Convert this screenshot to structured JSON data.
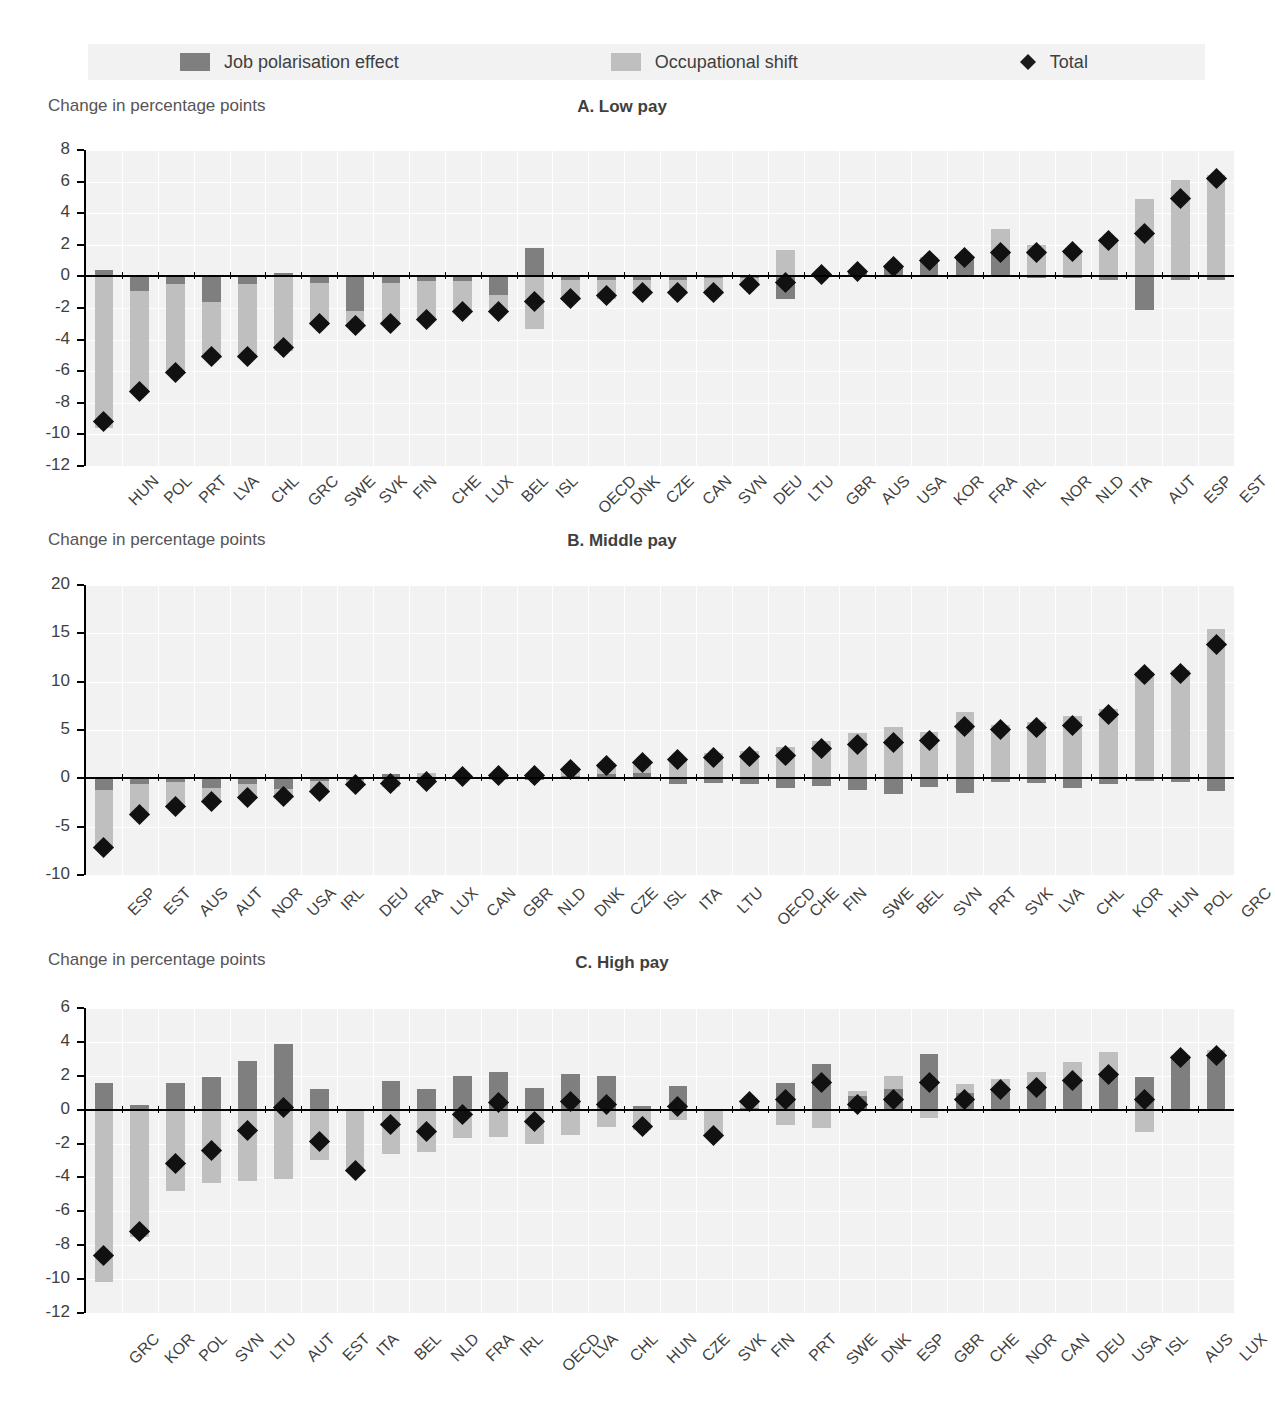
{
  "legend": {
    "items": [
      {
        "label": "Job polarisation effect",
        "icon": "square-dark-swatch",
        "color": "#7f7f7f"
      },
      {
        "label": "Occupational shift",
        "icon": "square-light-swatch",
        "color": "#bfbfbf"
      },
      {
        "label": "Total",
        "icon": "diamond-marker",
        "color": "#111111"
      }
    ]
  },
  "axis_title": "Change in percentage points",
  "colors": {
    "job_polarisation": "#7f7f7f",
    "occupational_shift": "#bfbfbf",
    "total_marker": "#111111",
    "plot_background": "#f2f2f2",
    "gridline": "#ffffff",
    "axis": "#000000"
  },
  "chart_data": [
    {
      "type": "bar",
      "title": "A. Low pay",
      "panel": "A",
      "xlabel": "",
      "ylabel": "Change in percentage points",
      "ylim": [
        -12,
        8
      ],
      "yticks": [
        8,
        6,
        4,
        2,
        0,
        -2,
        -4,
        -6,
        -8,
        -10,
        -12
      ],
      "grid": true,
      "stacked": true,
      "legend_position": "top",
      "categories": [
        "HUN",
        "POL",
        "PRT",
        "LVA",
        "CHL",
        "GRC",
        "SWE",
        "SVK",
        "FIN",
        "CHE",
        "LUX",
        "BEL",
        "ISL",
        "OECD",
        "DNK",
        "CZE",
        "CAN",
        "SVN",
        "DEU",
        "LTU",
        "GBR",
        "AUS",
        "USA",
        "KOR",
        "FRA",
        "IRL",
        "NOR",
        "NLD",
        "ITA",
        "AUT",
        "ESP",
        "EST"
      ],
      "series": [
        {
          "name": "Job polarisation effect",
          "values": [
            0.4,
            -0.9,
            -0.5,
            -1.6,
            -0.5,
            0.2,
            -0.4,
            -2.2,
            -0.4,
            -0.3,
            -0.3,
            -1.2,
            1.8,
            -0.2,
            -0.2,
            -0.2,
            -0.2,
            -0.1,
            -0.1,
            -1.4,
            0.1,
            0.2,
            0.6,
            1.0,
            1.2,
            1.5,
            -0.1,
            -0.1,
            -0.2,
            -2.1,
            -0.2,
            -0.2
          ]
        },
        {
          "name": "Occupational shift",
          "values": [
            -9.6,
            -6.4,
            -5.7,
            -3.5,
            -4.6,
            -4.7,
            -2.7,
            -1.0,
            -2.7,
            -2.4,
            -1.9,
            -1.0,
            -3.3,
            -1.3,
            -1.2,
            -0.8,
            -0.8,
            -0.9,
            -0.4,
            1.7,
            0.0,
            0.1,
            0.0,
            0.2,
            0.0,
            1.5,
            2.0,
            1.7,
            2.4,
            4.9,
            6.1,
            6.4
          ]
        }
      ],
      "total": [
        -9.2,
        -7.3,
        -6.1,
        -5.1,
        -5.1,
        -4.5,
        -3.0,
        -3.1,
        -3.0,
        -2.7,
        -2.2,
        -2.2,
        -1.6,
        -1.4,
        -1.2,
        -1.0,
        -1.0,
        -1.0,
        -0.5,
        -0.4,
        0.1,
        0.3,
        0.6,
        1.0,
        1.2,
        1.5,
        1.5,
        1.6,
        2.3,
        2.7,
        4.9,
        6.2
      ]
    },
    {
      "type": "bar",
      "title": "B. Middle pay",
      "panel": "B",
      "xlabel": "",
      "ylabel": "Change in percentage points",
      "ylim": [
        -10,
        20
      ],
      "yticks": [
        20,
        15,
        10,
        5,
        0,
        -5,
        -10
      ],
      "grid": true,
      "stacked": true,
      "legend_position": "top",
      "categories": [
        "ESP",
        "EST",
        "AUS",
        "AUT",
        "NOR",
        "USA",
        "IRL",
        "DEU",
        "FRA",
        "LUX",
        "CAN",
        "GBR",
        "NLD",
        "DNK",
        "CZE",
        "ISL",
        "ITA",
        "LTU",
        "OECD",
        "CHE",
        "FIN",
        "SWE",
        "BEL",
        "SVN",
        "PRT",
        "SVK",
        "LVA",
        "CHL",
        "KOR",
        "HUN",
        "POL",
        "GRC"
      ],
      "series": [
        {
          "name": "Job polarisation effect",
          "values": [
            -1.2,
            -0.6,
            -0.4,
            -1.0,
            -0.6,
            -1.1,
            -0.3,
            -0.2,
            0.4,
            -0.4,
            0.2,
            0.5,
            -0.2,
            0.2,
            0.4,
            0.6,
            -0.6,
            -0.5,
            -0.6,
            -1.0,
            -0.8,
            -1.2,
            -1.6,
            -0.9,
            -1.5,
            -0.4,
            -0.5,
            -1.0,
            -0.6,
            -0.3,
            -0.4,
            -1.3
          ]
        },
        {
          "name": "Occupational shift",
          "values": [
            -6.0,
            -3.1,
            -2.5,
            -1.4,
            -1.4,
            -0.8,
            -1.1,
            -0.4,
            -0.9,
            0.6,
            0.0,
            -0.2,
            0.5,
            0.7,
            0.9,
            1.0,
            2.0,
            2.6,
            2.8,
            3.2,
            3.9,
            4.7,
            5.3,
            4.8,
            6.9,
            5.5,
            5.8,
            6.5,
            7.2,
            11.0,
            11.2,
            15.5
          ]
        }
      ],
      "total": [
        -7.2,
        -3.7,
        -2.9,
        -2.4,
        -2.0,
        -1.9,
        -1.4,
        -0.6,
        -0.5,
        -0.3,
        0.2,
        0.3,
        0.3,
        0.9,
        1.3,
        1.6,
        2.0,
        2.2,
        2.3,
        2.4,
        3.1,
        3.5,
        3.7,
        3.9,
        5.4,
        5.1,
        5.3,
        5.5,
        6.6,
        10.7,
        10.8,
        13.8
      ]
    },
    {
      "type": "bar",
      "title": "C. High pay",
      "panel": "C",
      "xlabel": "",
      "ylabel": "Change in percentage points",
      "ylim": [
        -12,
        6
      ],
      "yticks": [
        6,
        4,
        2,
        0,
        -2,
        -4,
        -6,
        -8,
        -10,
        -12
      ],
      "grid": true,
      "stacked": true,
      "legend_position": "top",
      "categories": [
        "GRC",
        "KOR",
        "POL",
        "SVN",
        "LTU",
        "AUT",
        "EST",
        "ITA",
        "BEL",
        "NLD",
        "FRA",
        "IRL",
        "OECD",
        "LVA",
        "CHL",
        "HUN",
        "CZE",
        "SVK",
        "FIN",
        "PRT",
        "SWE",
        "DNK",
        "ESP",
        "GBR",
        "CHE",
        "NOR",
        "CAN",
        "DEU",
        "USA",
        "ISL",
        "AUS",
        "LUX"
      ],
      "series": [
        {
          "name": "Job polarisation effect",
          "values": [
            1.6,
            0.3,
            1.6,
            1.9,
            2.9,
            3.9,
            1.2,
            -0.1,
            1.7,
            1.2,
            2.0,
            2.2,
            1.3,
            2.1,
            2.0,
            0.2,
            1.4,
            -0.1,
            0.1,
            1.6,
            2.7,
            0.8,
            1.2,
            3.3,
            1.0,
            1.2,
            1.4,
            1.8,
            2.1,
            1.9,
            3.1,
            3.2
          ]
        },
        {
          "name": "Occupational shift",
          "values": [
            -10.2,
            -7.5,
            -4.8,
            -4.3,
            -4.2,
            -4.1,
            -3.0,
            -3.6,
            -2.6,
            -2.5,
            -1.7,
            -1.6,
            -2.0,
            -1.5,
            -1.0,
            -1.2,
            -0.6,
            -1.4,
            0.5,
            -0.9,
            -1.1,
            0.3,
            0.8,
            -0.5,
            0.5,
            0.6,
            0.8,
            1.0,
            1.3,
            -1.3,
            0.1,
            0.3
          ]
        }
      ],
      "total": [
        -8.6,
        -7.2,
        -3.2,
        -2.4,
        -1.2,
        0.1,
        -1.9,
        -3.6,
        -0.9,
        -1.3,
        -0.3,
        0.4,
        -0.7,
        0.5,
        0.3,
        -1.0,
        0.2,
        -1.5,
        0.5,
        0.6,
        1.6,
        0.3,
        0.6,
        1.6,
        0.6,
        1.2,
        1.3,
        1.7,
        2.1,
        0.6,
        3.1,
        3.2
      ]
    }
  ]
}
